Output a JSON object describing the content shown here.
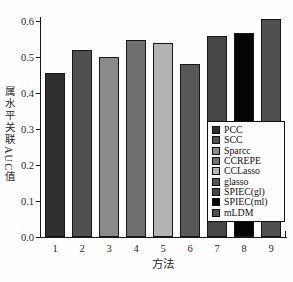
{
  "chart_data": {
    "type": "bar",
    "title": "",
    "xlabel": "方法",
    "ylabel": "属水平关联AUC值",
    "categories": [
      "1",
      "2",
      "3",
      "4",
      "5",
      "6",
      "7",
      "8",
      "9"
    ],
    "values": [
      0.455,
      0.52,
      0.5,
      0.548,
      0.54,
      0.48,
      0.558,
      0.568,
      0.605
    ],
    "ylim": [
      0,
      0.6
    ],
    "ytick_labels": [
      "0.0",
      "0.1",
      "0.2",
      "0.3",
      "0.4",
      "0.5",
      "0.6"
    ],
    "grid": false,
    "legend_position": "lower right",
    "legend": [
      {
        "label": "PCC",
        "color": "#2f2f2f"
      },
      {
        "label": "SCC",
        "color": "#505050"
      },
      {
        "label": "Sparcc",
        "color": "#8a8a8a"
      },
      {
        "label": "CCREPE",
        "color": "#707070"
      },
      {
        "label": "CCLasso",
        "color": "#b4b4b4"
      },
      {
        "label": "glasso",
        "color": "#585858"
      },
      {
        "label": "SPIEC(gl)",
        "color": "#464646"
      },
      {
        "label": "SPIEC(ml)",
        "color": "#050505"
      },
      {
        "label": "mLDM",
        "color": "#505050"
      }
    ]
  }
}
